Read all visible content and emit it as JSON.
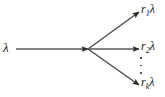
{
  "figure": {
    "name": "poisson-splitting-diagram",
    "type": "diagram",
    "background_color": "#ffffff",
    "stroke_color": "#4a4a4a",
    "text_color": "#1a1a1a"
  },
  "input": {
    "label_base": "λ",
    "label_full": "λ",
    "arrow_from": [
      16,
      49
    ],
    "arrow_to": [
      88,
      49
    ]
  },
  "branch_point": [
    88,
    49
  ],
  "outputs": [
    {
      "id": "out-1",
      "coefficient": "r",
      "subscript": "1",
      "rate": "λ",
      "label_full": "r₁λ",
      "arrow_from": [
        88,
        49
      ],
      "arrow_to": [
        139,
        12
      ]
    },
    {
      "id": "out-2",
      "coefficient": "r",
      "subscript": "2",
      "rate": "λ",
      "label_full": "r₂λ",
      "arrow_from": [
        88,
        49
      ],
      "arrow_to": [
        139,
        49
      ]
    },
    {
      "id": "out-k",
      "coefficient": "r",
      "subscript": "k",
      "rate": "λ",
      "label_full": "rₖλ",
      "arrow_from": [
        88,
        49
      ],
      "arrow_to": [
        139,
        85
      ]
    }
  ],
  "ellipsis": {
    "orientation": "vertical",
    "dot_count": 3,
    "meaning": "additional-output-streams"
  }
}
